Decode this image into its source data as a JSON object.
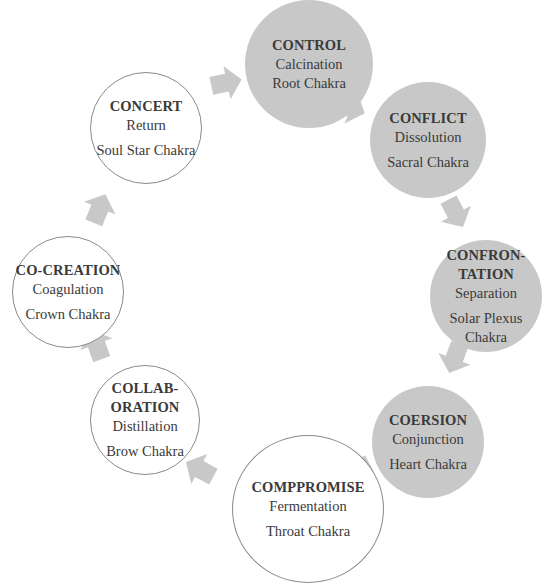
{
  "diagram": {
    "colors": {
      "filled": "#c8c8c8",
      "outline": "#8a8a8a",
      "arrow": "#c8c8c8",
      "text": "#3a3a3a"
    },
    "nodes": [
      {
        "title": "CONTROL",
        "process": "Calcination",
        "chakra": "Root Chakra",
        "style": "filled"
      },
      {
        "title": "CONFLICT",
        "process": "Dissolution",
        "chakra": "Sacral Chakra",
        "style": "filled"
      },
      {
        "title_line1": "CONFRON-",
        "title_line2": "TATION",
        "process": "Separation",
        "chakra_line1": "Solar Plexus",
        "chakra_line2": "Chakra",
        "style": "filled"
      },
      {
        "title": "COERSION",
        "process": "Conjunction",
        "chakra": "Heart Chakra",
        "style": "filled"
      },
      {
        "title": "COMPPROMISE",
        "process": "Fermentation",
        "chakra": "Throat Chakra",
        "style": "outline"
      },
      {
        "title_line1": "COLLAB-",
        "title_line2": "ORATION",
        "process": "Distillation",
        "chakra": "Brow Chakra",
        "style": "outline"
      },
      {
        "title": "CO-CREATION",
        "process": "Coagulation",
        "chakra": "Crown Chakra",
        "style": "outline"
      },
      {
        "title": "CONCERT",
        "process": "Return",
        "chakra": "Soul Star Chakra",
        "style": "outline"
      }
    ],
    "arrows": [
      {
        "from": "CONCERT",
        "to": "CONTROL"
      },
      {
        "from": "CONTROL",
        "to": "CONFLICT"
      },
      {
        "from": "CONFLICT",
        "to": "CONFRONTATION"
      },
      {
        "from": "CONFRONTATION",
        "to": "COERSION"
      },
      {
        "from": "COERSION",
        "to": "COMPPROMISE"
      },
      {
        "from": "COMPPROMISE",
        "to": "COLLABORATION"
      },
      {
        "from": "COLLABORATION",
        "to": "CO-CREATION"
      },
      {
        "from": "CO-CREATION",
        "to": "CONCERT"
      }
    ]
  }
}
